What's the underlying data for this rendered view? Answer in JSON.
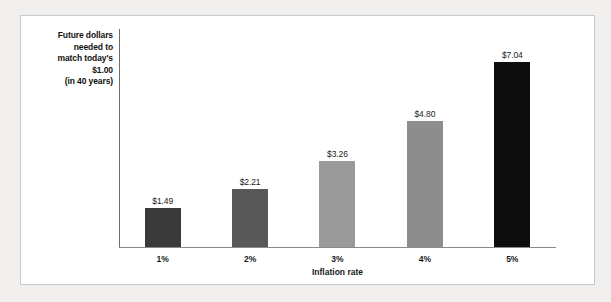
{
  "chart_data": {
    "type": "bar",
    "title": "",
    "xlabel": "Inflation rate",
    "ylabel": "Future dollars needed to match today's $1.00 (in 40 years)",
    "ylabel_lines": [
      "Future dollars",
      "needed to",
      "match today's",
      "$1.00",
      "(in 40 years)"
    ],
    "categories": [
      "1%",
      "2%",
      "3%",
      "4%",
      "5%"
    ],
    "values": [
      1.49,
      2.21,
      3.26,
      4.8,
      7.04
    ],
    "value_labels": [
      "$1.49",
      "$2.21",
      "$3.26",
      "$4.80",
      "$7.04"
    ],
    "bar_colors": [
      "#3a3a3a",
      "#585858",
      "#9a9a9a",
      "#8d8d8d",
      "#0d0d0d"
    ],
    "ylim": [
      0,
      7.04
    ],
    "grid": false,
    "legend": "none",
    "axis_color": "#8a8a8a",
    "background": "#ffffff",
    "page_background": "#f1efed"
  }
}
